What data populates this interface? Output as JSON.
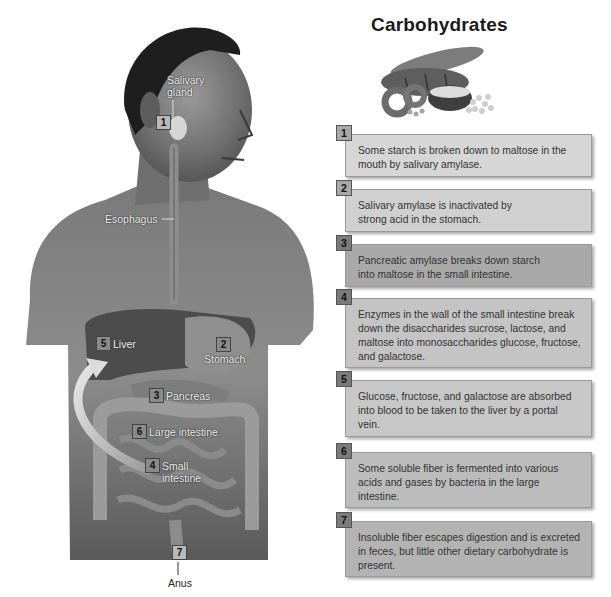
{
  "title": "Carbohydrates",
  "food_image": {
    "icon": "bread-pasta-rice-illustration",
    "alt": "bread, bagel, rice bowl and pasta"
  },
  "figure_labels": {
    "salivary_gland": "Salivary gland",
    "salivary_gland_line1": "Salivary",
    "salivary_gland_line2": "gland",
    "esophagus": "Esophagus",
    "liver": "Liver",
    "stomach": "Stomach",
    "pancreas": "Pancreas",
    "large_intestine": "Large intestine",
    "small_intestine_line1": "Small",
    "small_intestine_line2": "intestine",
    "anus": "Anus"
  },
  "figure_markers": {
    "salivary": "1",
    "stomach": "2",
    "pancreas": "3",
    "small_intestine": "4",
    "liver": "5",
    "large_intestine": "6",
    "anus": "7"
  },
  "steps": [
    {
      "number": "1",
      "text": "Some starch is broken down to maltose in the mouth by salivary amylase.",
      "bg": "#d6d6d6"
    },
    {
      "number": "2",
      "text": "Salivary amylase is inactivated by strong acid in the stomach.",
      "bg": "#d0d0d0"
    },
    {
      "number": "3",
      "text": "Pancreatic amylase breaks down starch into maltose in the small intestine.",
      "bg": "#a9a9a9"
    },
    {
      "number": "4",
      "text": "Enzymes in the wall of the small intestine break down the disaccharides sucrose, lactose, and maltose into monosaccharides glucose, fructose, and galactose.",
      "bg": "#c4c4c4"
    },
    {
      "number": "5",
      "text": "Glucose, fructose, and galactose are absorbed into blood to be taken to the liver by a portal vein.",
      "bg": "#c7c7c7"
    },
    {
      "number": "6",
      "text": "Some soluble fiber is fermented into various acids and gases by bacteria in the large intestine.",
      "bg": "#bcbcbc"
    },
    {
      "number": "7",
      "text": "Insoluble fiber escapes digestion and is excreted in feces, but little other dietary carbohydrate is present.",
      "bg": "#b3b3b3"
    }
  ]
}
